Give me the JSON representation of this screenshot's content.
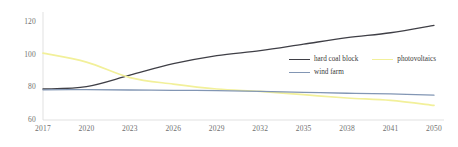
{
  "chart_data": {
    "type": "line",
    "title": "",
    "xlabel": "",
    "ylabel": "",
    "x": [
      2017,
      2020,
      2023,
      2026,
      2029,
      2032,
      2035,
      2038,
      2041,
      2050
    ],
    "xtick_labels": [
      "2017",
      "2020",
      "2023",
      "2026",
      "2029",
      "2032",
      "2035",
      "2038",
      "2041",
      "2050"
    ],
    "ytick_labels": [
      "120",
      "100",
      "80",
      "60"
    ],
    "yticks": [
      120,
      100,
      80,
      60
    ],
    "ylim": [
      60,
      125
    ],
    "xlim": [
      2017,
      2050
    ],
    "grid": false,
    "legend_position": "center-right",
    "series": [
      {
        "name": "hard coal block",
        "color": "#3f3f46",
        "values": [
          79.0,
          80.5,
          87.5,
          94.5,
          99.5,
          102.5,
          106.5,
          110.5,
          113.5,
          118.0
        ]
      },
      {
        "name": "photovoltaics",
        "color": "#f2f09a",
        "values": [
          101.0,
          95.5,
          86.0,
          82.0,
          79.0,
          77.5,
          75.5,
          73.5,
          72.0,
          69.0
        ]
      },
      {
        "name": "wind farm",
        "color": "#8296b4",
        "values": [
          78.5,
          78.6,
          78.4,
          78.2,
          78.0,
          77.6,
          77.0,
          76.4,
          76.0,
          75.2
        ]
      }
    ]
  },
  "axis": {
    "line_color": "#d9d9d9"
  }
}
